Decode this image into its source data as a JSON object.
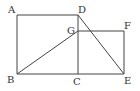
{
  "diagram": {
    "type": "geometry",
    "points": {
      "A": {
        "label": "A",
        "x": 17,
        "y": 15
      },
      "B": {
        "label": "B",
        "x": 17,
        "y": 74
      },
      "C": {
        "label": "C",
        "x": 78,
        "y": 74
      },
      "D": {
        "label": "D",
        "x": 78,
        "y": 15
      },
      "E": {
        "label": "E",
        "x": 124,
        "y": 74
      },
      "F": {
        "label": "F",
        "x": 124,
        "y": 31
      },
      "G": {
        "label": "G",
        "x": 78,
        "y": 31
      }
    },
    "segments": [
      [
        "A",
        "D"
      ],
      [
        "A",
        "B"
      ],
      [
        "B",
        "E"
      ],
      [
        "D",
        "C"
      ],
      [
        "G",
        "F"
      ],
      [
        "F",
        "E"
      ],
      [
        "B",
        "G"
      ],
      [
        "D",
        "E"
      ]
    ],
    "line_color": "#444444",
    "label_color": "#333333"
  }
}
